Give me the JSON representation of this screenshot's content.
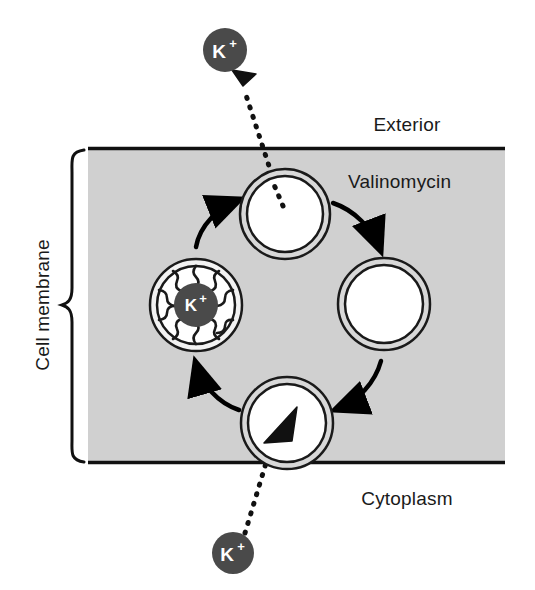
{
  "figure": {
    "type": "biological-mechanism-diagram"
  },
  "labels": {
    "exterior": "Exterior",
    "cytoplasm": "Cytoplasm",
    "valinomycin": "Valinomycin",
    "cell_membrane": "Cell membrane"
  },
  "ions": {
    "symbol": "K",
    "charge": "+",
    "exterior_ion_label": "K+",
    "cytoplasm_ion_label": "K+",
    "complexed_ion_label": "K+"
  },
  "colors": {
    "membrane_fill": "#d0d0d0",
    "membrane_border": "#111111",
    "ion_fill": "#4a4a4a",
    "ion_text": "#ffffff",
    "ring_outline": "#1a1a1a",
    "ring_band": "#d8d8d8",
    "ring_interior": "#ffffff",
    "arrow": "#000000",
    "text": "#1a1a1a",
    "background": "#ffffff"
  },
  "membrane": {
    "left": 88,
    "right": 505,
    "top": 147,
    "bottom": 464
  },
  "cycle": {
    "direction": "counterclockwise",
    "stages": [
      {
        "id": "complexed-carrier",
        "name": "valinomycin-potassium-complex",
        "position": "left",
        "cx": 196,
        "cy": 305,
        "r": 46,
        "contains_ion": true,
        "tendrils": 10
      },
      {
        "id": "loaded-carrier-top",
        "name": "valinomycin-at-exterior-face",
        "position": "top",
        "cx": 285,
        "cy": 214,
        "r": 45,
        "contains_ion": false
      },
      {
        "id": "empty-carrier-right",
        "name": "valinomycin-empty",
        "position": "right",
        "cx": 384,
        "cy": 304,
        "r": 46,
        "contains_ion": false
      },
      {
        "id": "loading-carrier-bottom",
        "name": "valinomycin-at-cytoplasm-face",
        "position": "bottom",
        "cx": 287,
        "cy": 423,
        "r": 46,
        "contains_ion": false
      }
    ],
    "arrows": [
      {
        "from": "complexed-carrier",
        "to": "loaded-carrier-top",
        "name": "arrow-complex-to-top"
      },
      {
        "from": "loaded-carrier-top",
        "to": "empty-carrier-right",
        "name": "arrow-top-to-right"
      },
      {
        "from": "empty-carrier-right",
        "to": "loading-carrier-bottom",
        "name": "arrow-right-to-bottom"
      },
      {
        "from": "loading-carrier-bottom",
        "to": "complexed-carrier",
        "name": "arrow-bottom-to-complex"
      }
    ]
  },
  "transport": {
    "release": {
      "name": "potassium-release-to-exterior",
      "ion_cx": 225,
      "ion_cy": 50,
      "ion_r": 22,
      "direction": "out-of-membrane"
    },
    "uptake": {
      "name": "potassium-uptake-from-cytoplasm",
      "ion_cx": 233,
      "ion_cy": 553,
      "ion_r": 21,
      "direction": "into-membrane"
    }
  }
}
